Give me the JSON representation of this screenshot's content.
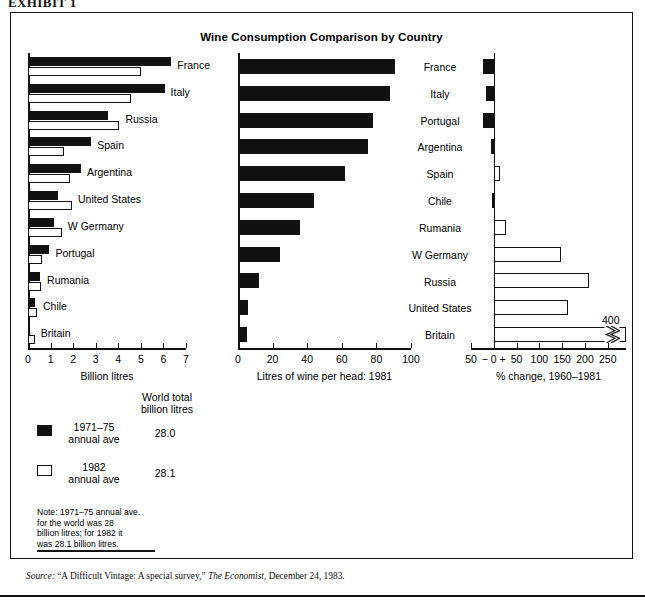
{
  "exhibit": {
    "label": "EXHIBIT 1"
  },
  "chart_title": "Wine Consumption Comparison by Country",
  "legend": {
    "header_line1": "World total",
    "header_line2": "billion litres",
    "items": [
      {
        "swatch": "dark",
        "line1": "1971–75",
        "line2": "annual ave",
        "value": "28.0"
      },
      {
        "swatch": "light",
        "line1": "1982",
        "line2": "annual ave",
        "value": "28.1"
      }
    ],
    "note": "Note:  1971–75 annual ave.\nfor the world was 28\nbillion litres; for 1982 it\nwas 28.1 billion litres."
  },
  "source": {
    "prefix_italic": "Source:",
    "text": " “A Difficult Vintage: A special survey,” ",
    "publication_italic": "The Economist",
    "suffix": ", December 24, 1983."
  },
  "chart_data": [
    {
      "id": "total-consumption",
      "type": "bar",
      "orientation": "horizontal",
      "title": "",
      "xlabel": "Billion litres",
      "ylabel": "",
      "xlim": [
        0,
        7
      ],
      "xticks": [
        0,
        1,
        2,
        3,
        4,
        5,
        6,
        7
      ],
      "xticklabels": [
        "0",
        "1",
        "2",
        "3",
        "4",
        "5",
        "6",
        "7"
      ],
      "grid": false,
      "legend_position": "below-left",
      "categories": [
        "France",
        "Italy",
        "Russia",
        "Spain",
        "Argentina",
        "United States",
        "W Germany",
        "Portugal",
        "Rumania",
        "Chile",
        "Britain"
      ],
      "series": [
        {
          "name": "1971–75 annual ave",
          "style": "dark",
          "values": [
            6.35,
            6.05,
            3.55,
            2.8,
            2.35,
            1.35,
            1.15,
            0.95,
            0.55,
            0.32,
            0.06
          ]
        },
        {
          "name": "1982 annual ave",
          "style": "light",
          "values": [
            5.0,
            4.55,
            4.05,
            1.6,
            1.85,
            1.95,
            1.5,
            0.62,
            0.58,
            0.4,
            0.3
          ]
        }
      ]
    },
    {
      "id": "per-head-1981",
      "type": "bar",
      "orientation": "horizontal",
      "title": "",
      "xlabel": "Litres of wine per head:  1981",
      "ylabel": "",
      "xlim": [
        0,
        100
      ],
      "xticks": [
        0,
        20,
        40,
        60,
        80,
        100
      ],
      "xticklabels": [
        "0",
        "20",
        "40",
        "60",
        "80",
        "100"
      ],
      "grid": false,
      "categories": [
        "France",
        "Italy",
        "Portugal",
        "Argentina",
        "Spain",
        "Chile",
        "Rumania",
        "W Germany",
        "Russia",
        "United States",
        "Britain"
      ],
      "series": [
        {
          "name": "Litres per head 1981",
          "style": "dark",
          "values": [
            91,
            88,
            78,
            75,
            62,
            44,
            36,
            24,
            12,
            6,
            5
          ]
        }
      ]
    },
    {
      "id": "pct-change-1960-1981",
      "type": "bar",
      "orientation": "horizontal",
      "title": "",
      "xlabel": "% change, 1960–1981",
      "ylabel": "",
      "xlim": [
        -50,
        290
      ],
      "xticks": [
        -50,
        0,
        50,
        100,
        150,
        200,
        250
      ],
      "xticklabels": [
        "50",
        "− 0 +",
        "50",
        "100",
        "150",
        "200",
        "250"
      ],
      "grid": false,
      "categories": [
        "France",
        "Italy",
        "Portugal",
        "Argentina",
        "Spain",
        "Chile",
        "Rumania",
        "W Germany",
        "Russia",
        "United States",
        "Britain"
      ],
      "series": [
        {
          "name": "% change 1960–1981",
          "style": "mixed",
          "values": [
            -23,
            -17,
            -24,
            -6,
            13,
            -5,
            27,
            147,
            208,
            163,
            400
          ],
          "styles": [
            "dark",
            "dark",
            "dark",
            "dark",
            "light",
            "dark",
            "light",
            "light",
            "light",
            "light",
            "light"
          ]
        }
      ],
      "annotations": [
        {
          "text": "400",
          "category": "Britain",
          "note": "axis break; bar truncated with zigzag"
        }
      ]
    }
  ]
}
